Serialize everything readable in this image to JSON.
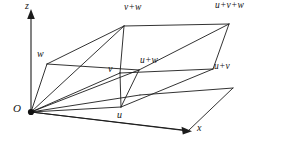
{
  "figure": {
    "background_color": "#ffffff",
    "ink_color": "#1c1c1c",
    "width": 283,
    "height": 146
  },
  "axes": {
    "vertical": {
      "label": "z",
      "label_x": 27,
      "label_y": 2,
      "from": [
        31,
        112
      ],
      "to": [
        31,
        14
      ]
    },
    "horizontal": {
      "label": "x",
      "label_x": 198,
      "label_y": 124,
      "from": [
        31,
        112
      ],
      "to": [
        188,
        131
      ]
    }
  },
  "origin": {
    "label": "O",
    "label_x": 14,
    "label_y": 103,
    "point": [
      31,
      112
    ],
    "dot_radius": 3.1
  },
  "vertices": [
    {
      "name": "origin",
      "label": "O",
      "x": 31,
      "y": 112,
      "label_x": 14,
      "label_y": 103
    },
    {
      "name": "u",
      "label": "u",
      "x": 121,
      "y": 107,
      "label_x": 118,
      "label_y": 110
    },
    {
      "name": "v",
      "label": "v",
      "x": 120,
      "y": 73,
      "label_x": 108,
      "label_y": 64
    },
    {
      "name": "w",
      "label": "w",
      "x": 47,
      "y": 64,
      "label_x": 38,
      "label_y": 50
    },
    {
      "name": "u-plus-v",
      "label": "u+v",
      "x": 213,
      "y": 69,
      "label_x": 215,
      "label_y": 63
    },
    {
      "name": "u-plus-w",
      "label": "u+w",
      "x": 139,
      "y": 70,
      "label_x": 141,
      "label_y": 57
    },
    {
      "name": "v-plus-w",
      "label": "v+w",
      "x": 124,
      "y": 26,
      "label_x": 125,
      "label_y": 4
    },
    {
      "name": "u-plus-v-plus-w",
      "label": "u+v+w",
      "x": 229,
      "y": 24,
      "label_x": 217,
      "label_y": 2
    }
  ],
  "labels": {
    "z_axis": "z",
    "x_axis": "x",
    "origin": "O",
    "u": "u",
    "v": "v",
    "w": "w",
    "u_plus_v": "u+v",
    "u_plus_w": "u+w",
    "v_plus_w": "v+w",
    "u_plus_v_plus_w": "u+v+w"
  },
  "geometry": {
    "description": "Wireframe parallelepiped with base parallelogram O-u-(u+v)-v, top face w-(u+w)-(u+v+w)-(v+w), vertical-ish edges joining them, plus an extra base plane parallelogram below.",
    "top_face": [
      [
        47,
        64
      ],
      [
        139,
        70
      ],
      [
        229,
        24
      ],
      [
        124,
        26
      ]
    ],
    "mid_face": [
      [
        31,
        112
      ],
      [
        121,
        107
      ],
      [
        213,
        69
      ],
      [
        120,
        73
      ]
    ],
    "lower_plane": [
      [
        31,
        112
      ],
      [
        121,
        107
      ],
      [
        213,
        69
      ],
      [
        120,
        73
      ]
    ],
    "side_edges": [
      [
        [
          31,
          112
        ],
        [
          47,
          64
        ]
      ],
      [
        [
          121,
          107
        ],
        [
          139,
          70
        ]
      ],
      [
        [
          213,
          69
        ],
        [
          229,
          24
        ]
      ],
      [
        [
          120,
          73
        ],
        [
          124,
          26
        ]
      ]
    ]
  }
}
